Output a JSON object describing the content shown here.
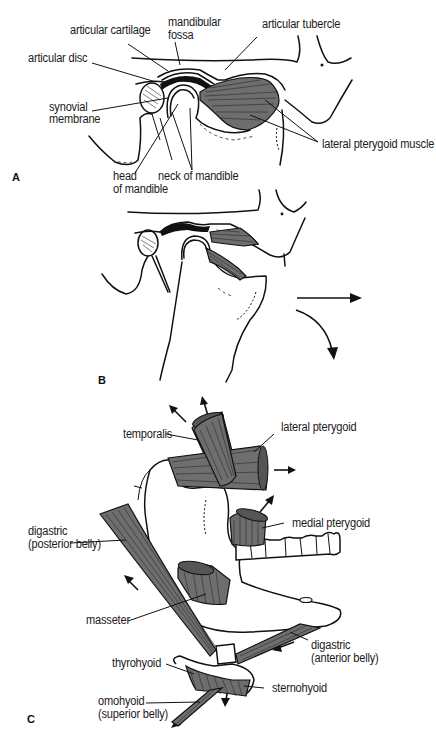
{
  "panels": {
    "A": {
      "letter": "A",
      "labels": {
        "articular_cartilage": "articular cartilage",
        "mandibular_fossa_1": "mandibular",
        "mandibular_fossa_2": "fossa",
        "articular_tubercle": "articular tubercle",
        "articular_disc": "articular disc",
        "synovial_membrane_1": "synovial",
        "synovial_membrane_2": "membrane",
        "lateral_pterygoid_muscle": "lateral pterygoid muscle",
        "head_of_mandible_1": "head",
        "head_of_mandible_2": "of mandible",
        "neck_of_mandible": "neck of mandible"
      }
    },
    "B": {
      "letter": "B",
      "arrows": [
        "forward-translation-arrow",
        "downward-rotation-arrow"
      ]
    },
    "C": {
      "letter": "C",
      "labels": {
        "temporalis": "temporalis",
        "lateral_pterygoid": "lateral pterygoid",
        "medial_pterygoid": "medial pterygoid",
        "digastric_posterior_1": "digastric",
        "digastric_posterior_2": "(posterior belly)",
        "masseter": "masseter",
        "digastric_anterior_1": "digastric",
        "digastric_anterior_2": "(anterior belly)",
        "thyrohyoid": "thyrohyoid",
        "sternohyoid": "sternohyoid",
        "omohyoid_1": "omohyoid",
        "omohyoid_2": "(superior belly)"
      }
    }
  },
  "colors": {
    "ink": "#111111",
    "muscle_fill": "#6e6e6e",
    "background": "#ffffff"
  }
}
